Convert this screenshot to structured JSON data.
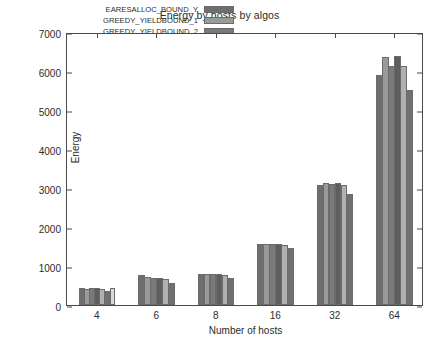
{
  "chart_data": {
    "type": "bar",
    "title": "Energy by hosts by algos",
    "xlabel": "Number of hosts",
    "ylabel": "Energy",
    "categories": [
      "4",
      "6",
      "8",
      "16",
      "32",
      "64"
    ],
    "ylim": [
      0,
      7000
    ],
    "yticks": [
      0,
      1000,
      2000,
      3000,
      4000,
      5000,
      6000,
      7000
    ],
    "grid": false,
    "legend_position": "top-center",
    "series": [
      {
        "name": "EARESALLOC_BOUND_Y",
        "color": "#6e6e6e",
        "values": [
          430,
          780,
          800,
          1555,
          3085,
          5910
        ]
      },
      {
        "name": "GREEDY_YIELDBOUND_1",
        "color": "#9a9a9a",
        "values": [
          420,
          720,
          790,
          1560,
          3120,
          6360
        ]
      },
      {
        "name": "GREEDY_YIELDBOUND_2",
        "color": "#7a7a7a",
        "values": [
          425,
          700,
          800,
          1560,
          3100,
          6130
        ]
      },
      {
        "name": "GREEDY_YIELDBOUND_3",
        "color": "#5e5e5e",
        "values": [
          430,
          690,
          795,
          1565,
          3135,
          6380
        ]
      },
      {
        "name": "GREEDY_YIELDBOUND_4",
        "color": "#b0b0b0",
        "values": [
          410,
          660,
          760,
          1545,
          3090,
          6120
        ]
      },
      {
        "name": "LPBOUND",
        "color": "#707070",
        "values": [
          360,
          560,
          700,
          1450,
          2845,
          5520
        ]
      },
      {
        "name": "MILP",
        "color": "#d8d8d8",
        "values": [
          440,
          0,
          0,
          0,
          0,
          0
        ]
      }
    ]
  },
  "caption": {
    "text": ""
  }
}
